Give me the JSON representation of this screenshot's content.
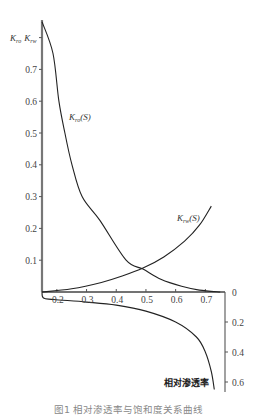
{
  "chart_data": {
    "type": "line",
    "title": "",
    "caption": "图1  相对渗透率与饱和度关系曲线",
    "xlabel": "",
    "ylabel": "K_ro  K_rw",
    "ylabel_parts": {
      "k1": "K",
      "s1": "ro",
      "k2": "K",
      "s2": "rw"
    },
    "xlim": [
      0.15,
      0.75
    ],
    "ylim": [
      0,
      0.85
    ],
    "x_ticks": [
      0.2,
      0.3,
      0.4,
      0.5,
      0.6,
      0.7
    ],
    "x_tick_labels": [
      "0.2",
      "0.3",
      "0.4",
      "0.5",
      "0.6",
      "0.7"
    ],
    "y_ticks": [
      0.1,
      0.2,
      0.3,
      0.4,
      0.5,
      0.6,
      0.7
    ],
    "y_tick_labels": [
      "0.1",
      "0.2",
      "0.3",
      "0.4",
      "0.5",
      "0.6",
      "0.7"
    ],
    "grid": false,
    "series": [
      {
        "name": "K_ro(S)",
        "label_k": "K",
        "label_sub": "ro",
        "label_tail": "(S)",
        "x": [
          0.15,
          0.187,
          0.207,
          0.227,
          0.251,
          0.285,
          0.345,
          0.433,
          0.49,
          0.55,
          0.62,
          0.68,
          0.75
        ],
        "values": [
          0.85,
          0.75,
          0.6,
          0.5,
          0.4,
          0.3,
          0.225,
          0.1,
          0.072,
          0.04,
          0.018,
          0.006,
          0.0
        ]
      },
      {
        "name": "K_rw(S)",
        "label_k": "K",
        "label_sub": "rw",
        "label_tail": "(S)",
        "x": [
          0.15,
          0.25,
          0.35,
          0.42,
          0.49,
          0.56,
          0.63,
          0.68,
          0.72
        ],
        "values": [
          0.0,
          0.01,
          0.03,
          0.05,
          0.075,
          0.11,
          0.16,
          0.21,
          0.27
        ]
      },
      {
        "name": "相对渗透率 (lower, inverted right axis)",
        "axis": "right-inverted",
        "x": [
          0.15,
          0.155,
          0.19,
          0.3,
          0.4,
          0.5,
          0.6,
          0.67,
          0.7,
          0.72,
          0.73
        ],
        "values": [
          0.0,
          0.04,
          0.05,
          0.067,
          0.087,
          0.127,
          0.2,
          0.3,
          0.4,
          0.53,
          0.65
        ]
      }
    ],
    "right_axis": {
      "inverted": true,
      "ticks": [
        0,
        0.2,
        0.4,
        0.6
      ],
      "tick_labels": [
        "0",
        "0.2",
        "0.4",
        "0.6"
      ],
      "label": "相对渗透率"
    }
  }
}
